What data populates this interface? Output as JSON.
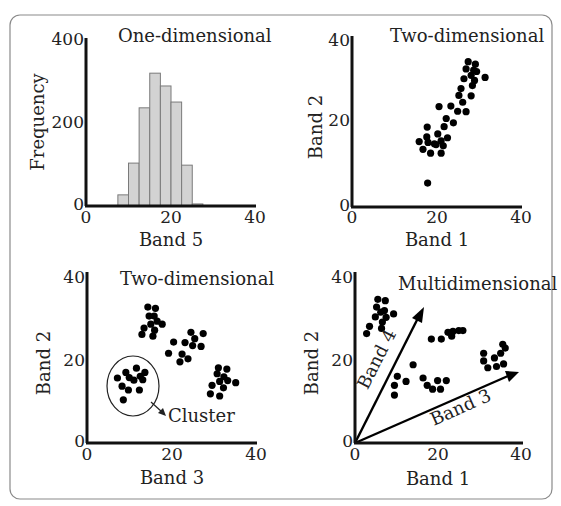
{
  "figure": {
    "frame_color": "#8a8a8a",
    "bar_color": "#d3d3d3",
    "point_color": "#000000"
  },
  "panels": [
    {
      "id": "one-dimensional",
      "title": "One-dimensional",
      "xlabel": "Band 5",
      "ylabel": "Frequency",
      "xticks": [
        "0",
        "20",
        "40"
      ],
      "yticks": [
        "0",
        "200",
        "400"
      ]
    },
    {
      "id": "two-dimensional-a",
      "title": "Two-dimensional",
      "xlabel": "Band 1",
      "ylabel": "Band 2",
      "xticks": [
        "0",
        "20",
        "40"
      ],
      "yticks": [
        "0",
        "20",
        "40"
      ]
    },
    {
      "id": "two-dimensional-b",
      "title": "Two-dimensional",
      "xlabel": "Band 3",
      "ylabel": "Band 2",
      "xticks": [
        "0",
        "20",
        "40"
      ],
      "yticks": [
        "0",
        "20",
        "40"
      ],
      "annotation": "Cluster"
    },
    {
      "id": "multidimensional",
      "title": "Multidimensional",
      "xlabel": "Band 1",
      "ylabel": "Band 2",
      "xticks": [
        "0",
        "20",
        "40"
      ],
      "yticks": [
        "0",
        "20",
        "40"
      ],
      "vectors": [
        {
          "label": "Band 4",
          "from": [
            0,
            0
          ],
          "to": [
            8,
            31
          ]
        },
        {
          "label": "Band 3",
          "from": [
            0,
            0
          ],
          "to": [
            38,
            17
          ]
        }
      ]
    }
  ],
  "chart_data": [
    {
      "type": "bar",
      "title": "One-dimensional",
      "xlabel": "Band 5",
      "ylabel": "Frequency",
      "xlim": [
        0,
        40
      ],
      "ylim": [
        0,
        400
      ],
      "bin_width": 2.5,
      "categories": [
        "7.5",
        "10",
        "12.5",
        "15",
        "17.5",
        "20",
        "22.5",
        "25"
      ],
      "values": [
        27,
        104,
        238,
        322,
        291,
        252,
        99,
        5
      ]
    },
    {
      "type": "scatter",
      "title": "Two-dimensional",
      "xlabel": "Band 1",
      "ylabel": "Band 2",
      "xlim": [
        0,
        40
      ],
      "ylim": [
        0,
        40
      ],
      "points": [
        [
          27.5,
          34
        ],
        [
          29.2,
          33.4
        ],
        [
          27,
          32.3
        ],
        [
          28.8,
          32
        ],
        [
          29.5,
          31.7
        ],
        [
          28.2,
          30.8
        ],
        [
          31.5,
          30.3
        ],
        [
          26.5,
          30
        ],
        [
          29,
          29.6
        ],
        [
          28.5,
          28.4
        ],
        [
          25.8,
          27.7
        ],
        [
          28.2,
          26
        ],
        [
          25.3,
          26.1
        ],
        [
          26.2,
          24.5
        ],
        [
          20.6,
          23.5
        ],
        [
          23.4,
          23.6
        ],
        [
          25,
          22.4
        ],
        [
          27,
          22.3
        ],
        [
          22.3,
          20.7
        ],
        [
          24,
          19.7
        ],
        [
          21.8,
          18.8
        ],
        [
          17.8,
          18.7
        ],
        [
          20.3,
          17.1
        ],
        [
          17.7,
          16.4
        ],
        [
          22.6,
          16.2
        ],
        [
          19.5,
          14.8
        ],
        [
          21.1,
          15.5
        ],
        [
          15.9,
          15.3
        ],
        [
          18,
          15.1
        ],
        [
          19.9,
          14.6
        ],
        [
          21.6,
          14.3
        ],
        [
          16.8,
          13.5
        ],
        [
          18.6,
          12.6
        ],
        [
          21.1,
          12.6
        ],
        [
          17.9,
          5.6
        ]
      ]
    },
    {
      "type": "scatter",
      "title": "Two-dimensional",
      "xlabel": "Band 3",
      "ylabel": "Band 2",
      "xlim": [
        0,
        40
      ],
      "ylim": [
        0,
        40
      ],
      "clusters": [
        {
          "name": "cluster-1",
          "points": [
            [
              14.4,
              31.8
            ],
            [
              16.2,
              31.5
            ],
            [
              14.7,
              29.7
            ],
            [
              15.9,
              29.7
            ],
            [
              16.6,
              28.5
            ],
            [
              15.1,
              27.8
            ],
            [
              17.8,
              27.8
            ],
            [
              13.5,
              26.9
            ],
            [
              16,
              26.4
            ],
            [
              13,
              25.4
            ],
            [
              15.6,
              25
            ]
          ]
        },
        {
          "name": "cluster-2",
          "points": [
            [
              24.6,
              25.9
            ],
            [
              27.5,
              25.6
            ],
            [
              20.5,
              23.6
            ],
            [
              23.2,
              23.5
            ],
            [
              25.5,
              24.4
            ],
            [
              25,
              22.8
            ],
            [
              27,
              22.6
            ],
            [
              19.3,
              21
            ],
            [
              22.5,
              20.8
            ],
            [
              23.9,
              19.7
            ],
            [
              22,
              19
            ]
          ]
        },
        {
          "name": "cluster-3",
          "points": [
            [
              31.1,
              17.6
            ],
            [
              33.1,
              17.3
            ],
            [
              30.8,
              16.2
            ],
            [
              32.4,
              15.5
            ],
            [
              33.3,
              14.6
            ],
            [
              31.4,
              14.4
            ],
            [
              35.2,
              14.1
            ],
            [
              29.6,
              13.5
            ],
            [
              32.3,
              12.9
            ],
            [
              29.2,
              11.5
            ],
            [
              31.4,
              11
            ]
          ]
        },
        {
          "name": "cluster-4-annotated",
          "points": [
            [
              7.2,
              15.2
            ],
            [
              9.2,
              16.5
            ],
            [
              11.7,
              17.5
            ],
            [
              13.7,
              16.5
            ],
            [
              10,
              15.3
            ],
            [
              11.1,
              14.7
            ],
            [
              12.6,
              15.6
            ],
            [
              13.2,
              14.8
            ],
            [
              8.3,
              13.3
            ],
            [
              9.8,
              12.4
            ],
            [
              12.4,
              12.4
            ],
            [
              8.6,
              10.1
            ]
          ]
        }
      ]
    },
    {
      "type": "scatter",
      "title": "Multidimensional",
      "xlabel": "Band 1",
      "ylabel": "Band 2",
      "xlim": [
        0,
        40
      ],
      "ylim": [
        0,
        40
      ],
      "points": [
        [
          5.5,
          33.6
        ],
        [
          7.3,
          33.3
        ],
        [
          5.2,
          31.8
        ],
        [
          7.1,
          31
        ],
        [
          6.2,
          30.6
        ],
        [
          4.9,
          29.5
        ],
        [
          7.5,
          29.4
        ],
        [
          9.3,
          30.2
        ],
        [
          6.6,
          28.3
        ],
        [
          3.5,
          27.3
        ],
        [
          6.4,
          26.8
        ],
        [
          2.8,
          25.6
        ],
        [
          18.4,
          24.3
        ],
        [
          20.8,
          24.3
        ],
        [
          22.4,
          25.9
        ],
        [
          23.3,
          25
        ],
        [
          23.6,
          26.1
        ],
        [
          25,
          26.3
        ],
        [
          26,
          26.3
        ],
        [
          31,
          21
        ],
        [
          33.6,
          19.9
        ],
        [
          35.1,
          21
        ],
        [
          36.2,
          22.2
        ],
        [
          35.6,
          23.1
        ],
        [
          31,
          19.2
        ],
        [
          32,
          17.6
        ],
        [
          34.1,
          17.9
        ],
        [
          35.8,
          18.5
        ],
        [
          14,
          18.3
        ],
        [
          10.2,
          15.6
        ],
        [
          12.3,
          14.4
        ],
        [
          9.5,
          13.5
        ],
        [
          9.5,
          11.2
        ],
        [
          16.4,
          15.2
        ],
        [
          17.4,
          13.5
        ],
        [
          18.7,
          12.6
        ],
        [
          19.9,
          14.6
        ],
        [
          20.6,
          12.6
        ],
        [
          22,
          14.6
        ]
      ],
      "vectors": [
        {
          "label": "Band 4",
          "from": [
            0,
            0
          ],
          "to": [
            8,
            31
          ]
        },
        {
          "label": "Band 3",
          "from": [
            0,
            0
          ],
          "to": [
            38,
            17
          ]
        }
      ]
    }
  ]
}
